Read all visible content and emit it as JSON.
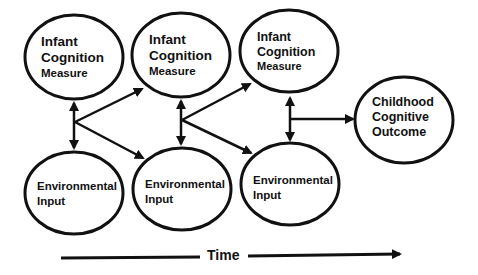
{
  "diagram": {
    "colors": {
      "stroke": "#111111",
      "background": "#ffffff"
    },
    "infant_nodes": [
      {
        "line1": "Infant",
        "line2": "Cognition",
        "line3": "Measure"
      },
      {
        "line1": "Infant",
        "line2": "Cognition",
        "line3": "Measure"
      },
      {
        "line1": "Infant",
        "line2": "Cognition",
        "line3": "Measure"
      }
    ],
    "environment_nodes": [
      {
        "line1": "Environmental",
        "line2": "Input"
      },
      {
        "line1": "Environmental",
        "line2": "Input"
      },
      {
        "line1": "Environmental",
        "line2": "Input"
      }
    ],
    "outcome_node": {
      "line1": "Childhood",
      "line2": "Cognitive",
      "line3": "Outcome"
    },
    "time_axis": {
      "label": "Time"
    },
    "edges": [
      {
        "from": "infant_1",
        "to": "environment_1",
        "type": "bidirectional"
      },
      {
        "from": "junction_1",
        "to": "infant_2",
        "type": "directed"
      },
      {
        "from": "junction_1",
        "to": "environment_2",
        "type": "directed"
      },
      {
        "from": "infant_2",
        "to": "environment_2",
        "type": "bidirectional"
      },
      {
        "from": "junction_2",
        "to": "infant_3",
        "type": "directed"
      },
      {
        "from": "junction_2",
        "to": "environment_3",
        "type": "directed"
      },
      {
        "from": "infant_3",
        "to": "environment_3",
        "type": "bidirectional"
      },
      {
        "from": "junction_3",
        "to": "outcome",
        "type": "directed"
      }
    ]
  }
}
